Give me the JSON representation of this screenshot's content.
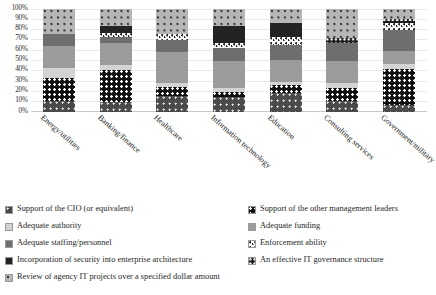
{
  "chart_data": {
    "type": "bar",
    "subtype": "stacked-percentage",
    "title": "",
    "xlabel": "",
    "ylabel": "",
    "ylim": [
      0,
      100
    ],
    "ytick_labels": [
      "100%",
      "90%",
      "80%",
      "70%",
      "60%",
      "50%",
      "40%",
      "30%",
      "20%",
      "10%",
      "0%"
    ],
    "ytick_values": [
      100,
      90,
      80,
      70,
      60,
      50,
      40,
      30,
      20,
      10,
      0
    ],
    "grid": true,
    "legend_position": "bottom",
    "categories": [
      "Energy/utilities",
      "Banking/finance",
      "Healthcare",
      "Information technology",
      "Education",
      "Consulting services",
      "Government/military"
    ],
    "series": [
      {
        "name": "Support of the CIO (or equivalent)",
        "key": "s0",
        "color": "#4a4a4a",
        "pattern": "dark-grey-light-dots",
        "values": [
          10,
          9,
          15,
          14,
          18,
          10,
          6
        ]
      },
      {
        "name": "Support of the other management leaders",
        "key": "s1",
        "color": "#101010",
        "pattern": "black-white-dots",
        "values": [
          23,
          31,
          9,
          5,
          8,
          13,
          35
        ]
      },
      {
        "name": "Adequate authority",
        "key": "s2",
        "color": "#d3d3d3",
        "pattern": "solid-light-grey",
        "values": [
          9,
          5,
          4,
          4,
          3,
          5,
          5
        ]
      },
      {
        "name": "Adequate funding",
        "key": "s3",
        "color": "#9b9b9b",
        "pattern": "solid-mid-light-grey",
        "values": [
          22,
          22,
          30,
          26,
          21,
          21,
          13
        ]
      },
      {
        "name": "Adequate staffing/personnel",
        "key": "s4",
        "color": "#6e6e6e",
        "pattern": "solid-mid-dark-grey",
        "values": [
          11,
          5,
          11,
          13,
          15,
          18,
          20
        ]
      },
      {
        "name": "Enforcement ability",
        "key": "s5",
        "color": "#fbfbfb",
        "pattern": "white-scattered-specks",
        "values": [
          0,
          4,
          6,
          5,
          7,
          0,
          7
        ]
      },
      {
        "name": "Incorporation of security into enterprise architecture",
        "key": "s6",
        "color": "#232323",
        "pattern": "solid-near-black",
        "values": [
          0,
          7,
          0,
          16,
          14,
          0,
          0
        ]
      },
      {
        "name": "An effective IT governance structure",
        "key": "s7",
        "color": "#1c1c1c",
        "pattern": "dark-fine-grid-dots",
        "values": [
          0,
          0,
          0,
          0,
          0,
          4,
          4
        ]
      },
      {
        "name": "Review of agency IT projects over a specified dollar amount",
        "key": "s8",
        "color": "#b6b6b6",
        "pattern": "light-grey-dark-dots",
        "values": [
          25,
          17,
          25,
          17,
          14,
          29,
          10
        ]
      }
    ]
  },
  "legend": {
    "left_column": [
      {
        "label": "Support of the CIO (or equivalent)",
        "key": "s0"
      },
      {
        "label": "Adequate authority",
        "key": "s2"
      },
      {
        "label": "Adequate staffing/personnel",
        "key": "s4"
      },
      {
        "label": "Incorporation of security into enterprise architecture",
        "key": "s6"
      },
      {
        "label": "Review of agency IT projects over a specified dollar amount",
        "key": "s8"
      }
    ],
    "right_column": [
      {
        "label": "Support of the other management leaders",
        "key": "s1"
      },
      {
        "label": "Adequate funding",
        "key": "s3"
      },
      {
        "label": "Enforcement ability",
        "key": "s5"
      },
      {
        "label": "An effective IT governance structure",
        "key": "s7"
      }
    ]
  }
}
